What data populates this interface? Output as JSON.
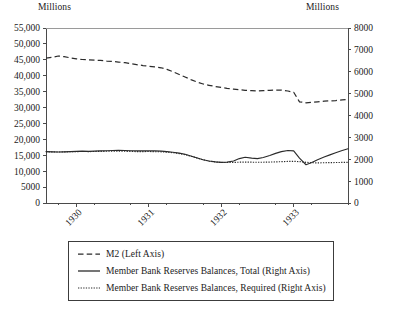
{
  "chart_data": {
    "type": "line",
    "title": "",
    "subtitle": "",
    "xlabel": "",
    "ylabel": "Millions",
    "y2label": "Millions",
    "grid": false,
    "legend_position": "bottom",
    "xlim": [
      1929.58,
      1933.75
    ],
    "ylim": [
      0,
      55000
    ],
    "y2lim": [
      0,
      8000
    ],
    "ytick_labels": [
      "0",
      "5000",
      "10,000",
      "15,000",
      "20,000",
      "25,000",
      "30,000",
      "35,000",
      "40,000",
      "45,000",
      "50,000",
      "55,000"
    ],
    "ytick_values": [
      0,
      5000,
      10000,
      15000,
      20000,
      25000,
      30000,
      35000,
      40000,
      45000,
      50000,
      55000
    ],
    "y2tick_labels": [
      "0",
      "1000",
      "2000",
      "3000",
      "4000",
      "5000",
      "6000",
      "7000",
      "8000"
    ],
    "y2tick_values": [
      0,
      1000,
      2000,
      3000,
      4000,
      5000,
      6000,
      7000,
      8000
    ],
    "xtick_labels": [
      "1930",
      "1931",
      "1932",
      "1933"
    ],
    "xtick_values": [
      1930,
      1931,
      1932,
      1933
    ],
    "x": [
      1929.58,
      1929.67,
      1929.75,
      1929.83,
      1929.92,
      1930.0,
      1930.08,
      1930.17,
      1930.25,
      1930.33,
      1930.42,
      1930.5,
      1930.58,
      1930.67,
      1930.75,
      1930.83,
      1930.92,
      1931.0,
      1931.08,
      1931.17,
      1931.25,
      1931.33,
      1931.42,
      1931.5,
      1931.58,
      1931.67,
      1931.75,
      1931.83,
      1931.92,
      1932.0,
      1932.08,
      1932.17,
      1932.25,
      1932.33,
      1932.42,
      1932.5,
      1932.58,
      1932.67,
      1932.75,
      1932.83,
      1932.92,
      1933.0,
      1933.08,
      1933.17,
      1933.25,
      1933.33,
      1933.42,
      1933.5,
      1933.58,
      1933.67,
      1933.75
    ],
    "series": [
      {
        "name": "M2 (Left Axis)",
        "axis": "left",
        "style": "dashed",
        "values": [
          45500,
          45800,
          46200,
          46000,
          45600,
          45300,
          45100,
          45000,
          44900,
          44800,
          44600,
          44500,
          44300,
          44100,
          43800,
          43500,
          43200,
          43000,
          42800,
          42500,
          42000,
          41300,
          40400,
          39600,
          38800,
          38000,
          37400,
          37000,
          36600,
          36300,
          36000,
          35800,
          35600,
          35400,
          35300,
          35200,
          35300,
          35400,
          35500,
          35500,
          35200,
          34800,
          31800,
          31500,
          31600,
          31800,
          32000,
          32100,
          32200,
          32400,
          32500
        ]
      },
      {
        "name": "Member Bank Reserves Balances, Total (Right Axis)",
        "axis": "right",
        "style": "solid",
        "values": [
          2350,
          2340,
          2330,
          2340,
          2350,
          2360,
          2370,
          2360,
          2370,
          2380,
          2390,
          2400,
          2410,
          2400,
          2390,
          2380,
          2380,
          2390,
          2380,
          2370,
          2350,
          2320,
          2280,
          2230,
          2150,
          2060,
          1980,
          1920,
          1880,
          1860,
          1870,
          1920,
          2030,
          2090,
          2050,
          2030,
          2080,
          2170,
          2270,
          2350,
          2400,
          2380,
          2050,
          1750,
          1850,
          1980,
          2100,
          2200,
          2300,
          2400,
          2480
        ]
      },
      {
        "name": "Member Bank Reserves Balances, Required (Right Axis)",
        "axis": "right",
        "style": "dotted",
        "values": [
          2340,
          2335,
          2330,
          2335,
          2345,
          2350,
          2355,
          2350,
          2355,
          2360,
          2365,
          2370,
          2375,
          2365,
          2360,
          2350,
          2350,
          2355,
          2345,
          2340,
          2325,
          2300,
          2260,
          2210,
          2140,
          2050,
          1975,
          1915,
          1875,
          1855,
          1850,
          1855,
          1865,
          1870,
          1865,
          1860,
          1865,
          1870,
          1880,
          1890,
          1900,
          1905,
          1890,
          1860,
          1840,
          1835,
          1840,
          1845,
          1850,
          1855,
          1860
        ]
      }
    ]
  },
  "labels": {
    "unit_left": "Millions",
    "unit_right": "Millions"
  },
  "legend": {
    "items": [
      {
        "label": "M2 (Left Axis)",
        "style": "dashed"
      },
      {
        "label": "Member Bank Reserves Balances, Total (Right Axis)",
        "style": "solid"
      },
      {
        "label": "Member Bank Reserves Balances, Required (Right Axis)",
        "style": "dotted"
      }
    ]
  }
}
